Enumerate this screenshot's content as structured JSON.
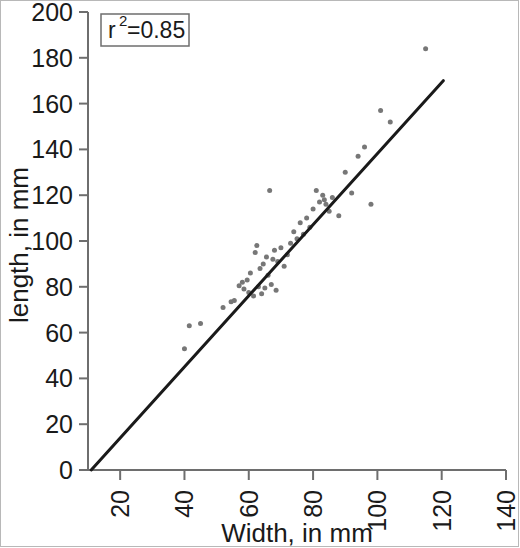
{
  "chart_data": {
    "type": "scatter",
    "title": "",
    "xlabel": "Width, in mm",
    "ylabel": "length, in mm",
    "xlim": [
      10,
      140
    ],
    "ylim": [
      0,
      200
    ],
    "xticks": [
      20,
      40,
      60,
      80,
      100,
      120,
      140
    ],
    "yticks": [
      0,
      20,
      40,
      60,
      80,
      100,
      120,
      140,
      160,
      180,
      200
    ],
    "xtick_labels": [
      "20",
      "40",
      "60",
      "80",
      "100",
      "120",
      "140"
    ],
    "ytick_labels": [
      "0",
      "20",
      "40",
      "60",
      "80",
      "100",
      "120",
      "140",
      "160",
      "180",
      "200"
    ],
    "xtick_rotation": -90,
    "grid": false,
    "legend": null,
    "annotations": [
      {
        "name": "r-squared-box",
        "text": "r2=0.85",
        "display_base": "r",
        "display_sup": "2",
        "display_rest": "=0.85",
        "x": 16,
        "y": 193
      }
    ],
    "series": [
      {
        "name": "observations",
        "type": "scatter",
        "marker": "circle",
        "color": "#777777",
        "size": 5,
        "points": [
          [
            40.0,
            53.0
          ],
          [
            41.5,
            63.0
          ],
          [
            45.0,
            64.0
          ],
          [
            52.0,
            71.0
          ],
          [
            54.5,
            73.5
          ],
          [
            55.5,
            74.0
          ],
          [
            57.0,
            80.5
          ],
          [
            58.0,
            82.0
          ],
          [
            58.5,
            79.0
          ],
          [
            59.5,
            83.0
          ],
          [
            60.0,
            77.5
          ],
          [
            60.5,
            86.0
          ],
          [
            61.5,
            76.0
          ],
          [
            62.0,
            95.0
          ],
          [
            62.5,
            98.0
          ],
          [
            63.0,
            80.0
          ],
          [
            63.5,
            88.0
          ],
          [
            64.0,
            77.0
          ],
          [
            64.5,
            90.0
          ],
          [
            65.0,
            79.5
          ],
          [
            65.5,
            93.0
          ],
          [
            66.0,
            85.0
          ],
          [
            66.5,
            122.0
          ],
          [
            67.0,
            81.0
          ],
          [
            67.5,
            92.0
          ],
          [
            68.0,
            96.0
          ],
          [
            68.5,
            78.5
          ],
          [
            69.0,
            91.0
          ],
          [
            70.0,
            97.0
          ],
          [
            71.0,
            89.0
          ],
          [
            72.0,
            94.0
          ],
          [
            73.0,
            99.0
          ],
          [
            74.0,
            104.0
          ],
          [
            75.0,
            101.0
          ],
          [
            76.0,
            108.0
          ],
          [
            77.0,
            103.0
          ],
          [
            78.0,
            110.0
          ],
          [
            79.0,
            106.0
          ],
          [
            80.0,
            114.0
          ],
          [
            81.0,
            122.0
          ],
          [
            82.0,
            117.0
          ],
          [
            83.0,
            120.0
          ],
          [
            83.5,
            118.0
          ],
          [
            84.0,
            116.0
          ],
          [
            85.0,
            113.0
          ],
          [
            86.0,
            119.0
          ],
          [
            88.0,
            111.0
          ],
          [
            90.0,
            130.0
          ],
          [
            92.0,
            121.0
          ],
          [
            94.0,
            137.0
          ],
          [
            96.0,
            141.0
          ],
          [
            98.0,
            116.0
          ],
          [
            101.0,
            157.0
          ],
          [
            104.0,
            152.0
          ],
          [
            115.0,
            184.0
          ]
        ]
      },
      {
        "name": "regression-line",
        "type": "line",
        "color": "#1a1a1a",
        "width": 3,
        "x0": 11.0,
        "y0": 0.0,
        "x1": 120.5,
        "y1": 170.0
      }
    ]
  },
  "axes": {
    "tick_color": "#6e6e6e",
    "spine_color": "#6e6e6e",
    "background": "#ffffff"
  },
  "figure": {
    "border_color": "#b8b8b8",
    "background": "#ffffff"
  }
}
